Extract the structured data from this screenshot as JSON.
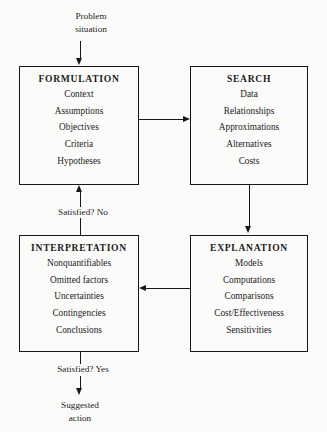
{
  "diagram": {
    "entry_label": {
      "line1": "Problem",
      "line2": "situation"
    },
    "exit_label": {
      "line1": "Suggested",
      "line2": "action"
    },
    "loop_label_no": "Satisfied? No",
    "loop_label_yes": "Satisfied? Yes",
    "boxes": [
      {
        "id": "formulation",
        "title": "FORMULATION",
        "items": [
          "Context",
          "Assumptions",
          "Objectives",
          "Criteria",
          "Hypotheses"
        ]
      },
      {
        "id": "search",
        "title": "SEARCH",
        "items": [
          "Data",
          "Relationships",
          "Approximations",
          "Alternatives",
          "Costs"
        ]
      },
      {
        "id": "interpretation",
        "title": "INTERPRETATION",
        "items": [
          "Nonquantifiables",
          "Omitted factors",
          "Uncertainties",
          "Contingencies",
          "Conclusions"
        ]
      },
      {
        "id": "explanation",
        "title": "EXPLANATION",
        "items": [
          "Models",
          "Computations",
          "Comparisons",
          "Cost/Effectiveness",
          "Sensitivities"
        ]
      }
    ],
    "colors": {
      "background": "#fbfbfa",
      "ink": "#171717"
    }
  }
}
